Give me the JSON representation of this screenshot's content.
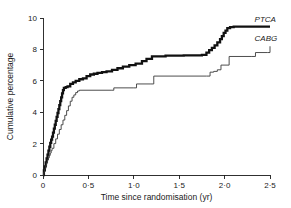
{
  "chart_data": {
    "type": "line",
    "title": "",
    "xlabel": "Time since randomisation (yr)",
    "ylabel": "Cumulative percentage",
    "xlim": [
      0,
      2.5
    ],
    "ylim": [
      0,
      10
    ],
    "grid": false,
    "legend_position": "right-inline",
    "xticks": [
      0,
      0.5,
      1.0,
      1.5,
      2.0,
      2.5
    ],
    "xtick_labels": [
      "0",
      "0·5",
      "1·0",
      "1·5",
      "2·0",
      "2·5"
    ],
    "yticks": [
      0,
      2,
      4,
      6,
      8,
      10
    ],
    "ytick_labels": [
      "0",
      "2",
      "4",
      "6",
      "8",
      "10"
    ],
    "step_type": "post",
    "series": [
      {
        "name": "PTCA",
        "label": "PTCA",
        "color": "#111111",
        "linewidth": 2.3,
        "label_x": 2.33,
        "label_y": 9.95,
        "final_value": 9.45,
        "x": [
          0.0,
          0.01,
          0.02,
          0.03,
          0.04,
          0.05,
          0.06,
          0.07,
          0.08,
          0.09,
          0.1,
          0.11,
          0.12,
          0.13,
          0.14,
          0.15,
          0.16,
          0.17,
          0.18,
          0.19,
          0.2,
          0.21,
          0.22,
          0.23,
          0.25,
          0.27,
          0.3,
          0.33,
          0.36,
          0.4,
          0.44,
          0.48,
          0.52,
          0.56,
          0.6,
          0.65,
          0.7,
          0.76,
          0.82,
          0.88,
          0.95,
          1.02,
          1.09,
          1.14,
          1.2,
          1.35,
          1.55,
          1.75,
          1.8,
          1.83,
          1.86,
          1.89,
          1.92,
          1.95,
          1.97,
          1.99,
          2.01,
          2.03,
          2.06,
          2.1,
          2.5
        ],
        "y": [
          0.0,
          0.3,
          0.55,
          0.8,
          1.05,
          1.3,
          1.55,
          1.8,
          2.05,
          2.25,
          2.45,
          2.7,
          2.95,
          3.2,
          3.45,
          3.7,
          3.95,
          4.2,
          4.45,
          4.7,
          4.95,
          5.2,
          5.4,
          5.55,
          5.6,
          5.65,
          5.8,
          5.9,
          6.0,
          6.1,
          6.15,
          6.3,
          6.4,
          6.45,
          6.5,
          6.55,
          6.6,
          6.7,
          6.8,
          6.9,
          7.0,
          7.1,
          7.25,
          7.4,
          7.55,
          7.6,
          7.62,
          7.65,
          7.8,
          7.95,
          8.1,
          8.25,
          8.45,
          8.65,
          8.85,
          9.05,
          9.2,
          9.35,
          9.42,
          9.45,
          9.45
        ]
      },
      {
        "name": "CABG",
        "label": "CABG",
        "color": "#3a3a3a",
        "linewidth": 0.9,
        "label_x": 2.33,
        "label_y": 8.75,
        "final_value": 8.2,
        "x": [
          0.0,
          0.01,
          0.02,
          0.03,
          0.04,
          0.05,
          0.06,
          0.07,
          0.08,
          0.09,
          0.1,
          0.12,
          0.14,
          0.16,
          0.18,
          0.2,
          0.22,
          0.24,
          0.26,
          0.28,
          0.3,
          0.32,
          0.34,
          0.36,
          0.38,
          0.4,
          0.75,
          0.78,
          1.0,
          1.03,
          1.18,
          1.22,
          1.8,
          1.84,
          1.88,
          1.92,
          1.96,
          2.05,
          2.3,
          2.34,
          2.47,
          2.5
        ],
        "y": [
          0.0,
          0.2,
          0.4,
          0.6,
          0.8,
          0.95,
          1.1,
          1.25,
          1.4,
          1.55,
          1.7,
          2.0,
          2.3,
          2.6,
          2.9,
          3.2,
          3.5,
          3.8,
          4.1,
          4.4,
          4.7,
          4.95,
          5.1,
          5.25,
          5.35,
          5.4,
          5.4,
          5.55,
          5.55,
          5.8,
          5.8,
          6.3,
          6.3,
          6.55,
          6.6,
          6.7,
          7.0,
          7.55,
          7.55,
          7.8,
          7.8,
          8.2
        ]
      }
    ]
  }
}
